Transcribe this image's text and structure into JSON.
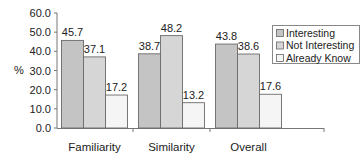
{
  "chart_data": {
    "type": "bar",
    "title": "",
    "xlabel": "",
    "ylabel": "%",
    "ylim": [
      0,
      60
    ],
    "yticks": [
      "0.0",
      "10.0",
      "20.0",
      "30.0",
      "40.0",
      "50.0",
      "60.0"
    ],
    "ytick_values": [
      0,
      10,
      20,
      30,
      40,
      50,
      60
    ],
    "categories": [
      "Familiarity",
      "Similarity",
      "Overall"
    ],
    "series": [
      {
        "name": "Interesting",
        "values": [
          45.7,
          38.7,
          43.8
        ],
        "color": "#c4c4c4"
      },
      {
        "name": "Not Interesting",
        "values": [
          37.1,
          48.2,
          38.6
        ],
        "color": "#d6d6d6"
      },
      {
        "name": "Already Know",
        "values": [
          17.2,
          13.2,
          17.6
        ],
        "color": "#f5f5f5"
      }
    ],
    "data_labels": [
      [
        "45.7",
        "38.7",
        "43.8"
      ],
      [
        "37.1",
        "48.2",
        "38.6"
      ],
      [
        "17.2",
        "13.2",
        "17.6"
      ]
    ],
    "legend": {
      "placement": "top-right",
      "entries": [
        "Interesting",
        "Not Interesting",
        "Already Know"
      ]
    },
    "grid": false
  }
}
